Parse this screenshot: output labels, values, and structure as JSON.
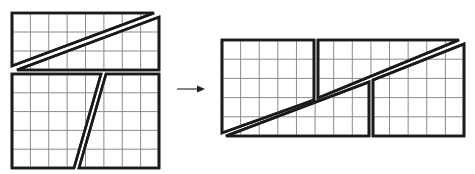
{
  "figure": {
    "colors": {
      "outline": "#1a1a1a",
      "grid": "#8a8a8a",
      "background": "#ffffff",
      "arrow": "#222222"
    },
    "grid_unit_px": 18.4
  },
  "left_figure": {
    "top_rect": {
      "x": 12,
      "y": 13,
      "w": 147,
      "h": 57,
      "cols": 8,
      "rows": 3
    },
    "bottom_rect": {
      "x": 12,
      "y": 74,
      "w": 147,
      "h": 94,
      "cols": 8,
      "rows": 5
    },
    "pieces": [
      {
        "name": "top-upper-triangle",
        "points": [
          [
            12,
            13
          ],
          [
            154,
            13
          ],
          [
            12,
            66
          ]
        ]
      },
      {
        "name": "top-lower-triangle",
        "points": [
          [
            159,
            17
          ],
          [
            159,
            70
          ],
          [
            17,
            70
          ]
        ]
      },
      {
        "name": "bottom-left-trapezoid",
        "points": [
          [
            12,
            74
          ],
          [
            101,
            74
          ],
          [
            74,
            168
          ],
          [
            12,
            168
          ]
        ]
      },
      {
        "name": "bottom-right-trapezoid",
        "points": [
          [
            106,
            74
          ],
          [
            159,
            74
          ],
          [
            159,
            168
          ],
          [
            79,
            168
          ]
        ]
      }
    ]
  },
  "arrow": {
    "x1": 177,
    "y1": 89,
    "x2": 205,
    "y2": 89
  },
  "right_figure": {
    "rect": {
      "x": 222,
      "y": 40,
      "w": 242,
      "h": 96,
      "cols": 13,
      "rows": 5
    },
    "pieces": [
      {
        "name": "left-block",
        "points": [
          [
            222,
            40
          ],
          [
            314,
            40
          ],
          [
            314,
            100
          ],
          [
            222,
            133
          ]
        ]
      },
      {
        "name": "upper-right-block",
        "points": [
          [
            318,
            40
          ],
          [
            459,
            40
          ],
          [
            318,
            98
          ]
        ]
      },
      {
        "name": "middle-lower-block",
        "points": [
          [
            226,
            136
          ],
          [
            369,
            82
          ],
          [
            369,
            136
          ]
        ]
      },
      {
        "name": "right-lower-block",
        "points": [
          [
            373,
            80
          ],
          [
            464,
            44
          ],
          [
            464,
            136
          ],
          [
            373,
            136
          ]
        ]
      }
    ]
  }
}
